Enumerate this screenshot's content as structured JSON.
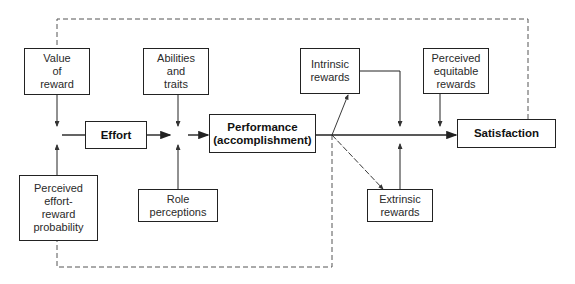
{
  "diagram": {
    "type": "flowchart",
    "title": "",
    "nodes": {
      "value_of_reward": "Value\nof\nreward",
      "perceived_effort_reward": "Perceived\neffort-\nreward\nprobability",
      "effort": "Effort",
      "abilities_traits": "Abilities\nand\ntraits",
      "role_perceptions": "Role\nperceptions",
      "performance": "Performance\n(accomplishment)",
      "intrinsic_rewards": "Intrinsic\nrewards",
      "extrinsic_rewards": "Extrinsic\nrewards",
      "perceived_equitable_rewards": "Perceived\nequitable\nrewards",
      "satisfaction": "Satisfaction"
    },
    "edges": [
      {
        "from": "value_of_reward",
        "to": "effort",
        "style": "solid"
      },
      {
        "from": "perceived_effort_reward",
        "to": "effort",
        "style": "solid"
      },
      {
        "from": "effort",
        "to": "performance",
        "style": "solid"
      },
      {
        "from": "abilities_traits",
        "to": "performance",
        "style": "solid"
      },
      {
        "from": "role_perceptions",
        "to": "performance",
        "style": "solid"
      },
      {
        "from": "performance",
        "to": "intrinsic_rewards",
        "style": "solid"
      },
      {
        "from": "performance",
        "to": "extrinsic_rewards",
        "style": "solid"
      },
      {
        "from": "performance",
        "to": "satisfaction",
        "style": "solid"
      },
      {
        "from": "intrinsic_rewards",
        "to": "satisfaction",
        "style": "solid"
      },
      {
        "from": "extrinsic_rewards",
        "to": "satisfaction",
        "style": "solid"
      },
      {
        "from": "perceived_equitable_rewards",
        "to": "satisfaction",
        "style": "solid"
      },
      {
        "from": "satisfaction",
        "to": "value_of_reward",
        "style": "dashed"
      },
      {
        "from": "performance",
        "to": "perceived_effort_reward",
        "style": "dashed"
      }
    ],
    "colors": {
      "line": "#222222",
      "dashed": "#555555",
      "background": "#ffffff"
    }
  }
}
